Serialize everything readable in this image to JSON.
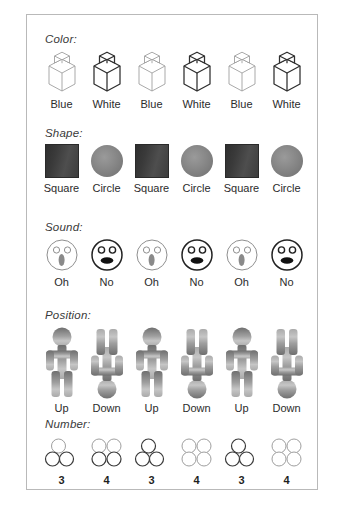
{
  "figure": {
    "frame_border_color": "#b9b9b9",
    "background_color": "#ffffff",
    "sections": [
      {
        "label": "Color:",
        "name": "color",
        "items": [
          {
            "caption": "Blue",
            "variant": "light"
          },
          {
            "caption": "White",
            "variant": "dark"
          },
          {
            "caption": "Blue",
            "variant": "light"
          },
          {
            "caption": "White",
            "variant": "dark"
          },
          {
            "caption": "Blue",
            "variant": "light"
          },
          {
            "caption": "White",
            "variant": "dark"
          }
        ]
      },
      {
        "label": "Shape:",
        "name": "shape",
        "items": [
          {
            "caption": "Square",
            "variant": "square"
          },
          {
            "caption": "Circle",
            "variant": "circle"
          },
          {
            "caption": "Square",
            "variant": "square"
          },
          {
            "caption": "Circle",
            "variant": "circle"
          },
          {
            "caption": "Square",
            "variant": "square"
          },
          {
            "caption": "Circle",
            "variant": "circle"
          }
        ]
      },
      {
        "label": "Sound:",
        "name": "sound",
        "items": [
          {
            "caption": "Oh",
            "variant": "oh"
          },
          {
            "caption": "No",
            "variant": "no"
          },
          {
            "caption": "Oh",
            "variant": "oh"
          },
          {
            "caption": "No",
            "variant": "no"
          },
          {
            "caption": "Oh",
            "variant": "oh"
          },
          {
            "caption": "No",
            "variant": "no"
          }
        ]
      },
      {
        "label": "Position:",
        "name": "position",
        "items": [
          {
            "caption": "Up",
            "variant": "up"
          },
          {
            "caption": "Down",
            "variant": "down"
          },
          {
            "caption": "Up",
            "variant": "up"
          },
          {
            "caption": "Down",
            "variant": "down"
          },
          {
            "caption": "Up",
            "variant": "up"
          },
          {
            "caption": "Down",
            "variant": "down"
          }
        ]
      },
      {
        "label": "Number:",
        "name": "number",
        "items": [
          {
            "caption": "3",
            "variant": "three"
          },
          {
            "caption": "4",
            "variant": "four"
          },
          {
            "caption": "3",
            "variant": "three"
          },
          {
            "caption": "4",
            "variant": "four"
          },
          {
            "caption": "3",
            "variant": "three"
          },
          {
            "caption": "4",
            "variant": "four"
          }
        ]
      }
    ]
  }
}
